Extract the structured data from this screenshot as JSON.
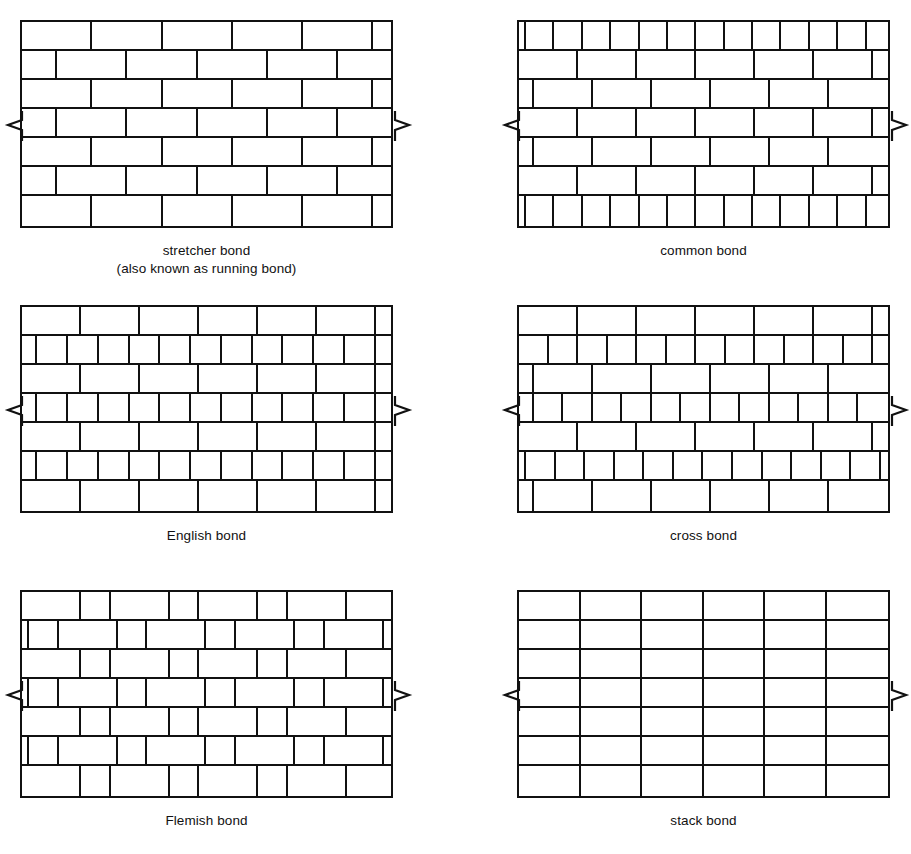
{
  "page": {
    "background": "#ffffff",
    "line_color": "#111111",
    "top_artifact": "· ·   ·    ·  ·     ·   ···"
  },
  "legend": {
    "brick_unit_note": "widths expressed in half-brick modules",
    "break_symbol": "zigzag-break"
  },
  "panels": [
    {
      "id": "stretcher-bond",
      "caption": "stretcher bond",
      "caption2": "(also known as running bond)",
      "col": 0,
      "row": 0,
      "courses": [
        [
          4,
          4,
          4,
          4,
          4,
          1
        ],
        [
          2,
          4,
          4,
          4,
          4,
          3
        ],
        [
          4,
          4,
          4,
          4,
          4,
          1
        ],
        [
          2,
          4,
          4,
          4,
          4,
          3
        ],
        [
          4,
          4,
          4,
          4,
          4,
          1
        ],
        [
          2,
          4,
          4,
          4,
          4,
          3
        ],
        [
          4,
          4,
          4,
          4,
          4,
          1
        ]
      ]
    },
    {
      "id": "common-bond",
      "caption": "common bond",
      "caption2": "",
      "col": 1,
      "row": 0,
      "courses": [
        [
          0.5,
          2,
          2,
          2,
          2,
          2,
          2,
          2,
          2,
          2,
          2,
          2,
          2,
          1.5
        ],
        [
          4,
          4,
          4,
          4,
          4,
          4,
          1
        ],
        [
          1,
          4,
          4,
          4,
          4,
          4,
          4
        ],
        [
          4,
          4,
          4,
          4,
          4,
          4,
          1
        ],
        [
          1,
          4,
          4,
          4,
          4,
          4,
          4
        ],
        [
          4,
          4,
          4,
          4,
          4,
          4,
          1
        ],
        [
          0.5,
          2,
          2,
          2,
          2,
          2,
          2,
          2,
          2,
          2,
          2,
          2,
          2,
          1.5
        ]
      ]
    },
    {
      "id": "english-bond",
      "caption": "English bond",
      "caption2": "",
      "col": 0,
      "row": 1,
      "courses": [
        [
          4,
          4,
          4,
          4,
          4,
          4,
          1
        ],
        [
          1,
          2,
          2,
          2,
          2,
          2,
          2,
          2,
          2,
          2,
          2,
          2,
          1
        ],
        [
          4,
          4,
          4,
          4,
          4,
          4,
          1
        ],
        [
          1,
          2,
          2,
          2,
          2,
          2,
          2,
          2,
          2,
          2,
          2,
          2,
          1
        ],
        [
          4,
          4,
          4,
          4,
          4,
          4,
          1
        ],
        [
          1,
          2,
          2,
          2,
          2,
          2,
          2,
          2,
          2,
          2,
          2,
          2,
          1
        ],
        [
          4,
          4,
          4,
          4,
          4,
          4,
          1
        ]
      ]
    },
    {
      "id": "cross-bond",
      "caption": "cross bond",
      "caption2": "",
      "col": 1,
      "row": 1,
      "courses": [
        [
          4,
          4,
          4,
          4,
          4,
          4,
          1
        ],
        [
          2,
          2,
          2,
          2,
          2,
          2,
          2,
          2,
          2,
          2,
          2,
          2,
          1
        ],
        [
          1,
          4,
          4,
          4,
          4,
          4,
          4
        ],
        [
          1,
          2,
          2,
          2,
          2,
          2,
          2,
          2,
          2,
          2,
          2,
          2,
          2
        ],
        [
          4,
          4,
          4,
          4,
          4,
          4,
          1
        ],
        [
          0.5,
          2,
          2,
          2,
          2,
          2,
          2,
          2,
          2,
          2,
          2,
          2,
          2,
          0.5
        ],
        [
          1,
          4,
          4,
          4,
          4,
          4,
          4
        ]
      ]
    },
    {
      "id": "flemish-bond",
      "caption": "Flemish bond",
      "caption2": "",
      "col": 0,
      "row": 2,
      "courses": [
        [
          4,
          2,
          4,
          2,
          4,
          2,
          4,
          3
        ],
        [
          0.5,
          2,
          4,
          2,
          4,
          2,
          4,
          2,
          4,
          0.5
        ],
        [
          4,
          2,
          4,
          2,
          4,
          2,
          4,
          3
        ],
        [
          0.5,
          2,
          4,
          2,
          4,
          2,
          4,
          2,
          4,
          0.5
        ],
        [
          4,
          2,
          4,
          2,
          4,
          2,
          4,
          3
        ],
        [
          0.5,
          2,
          4,
          2,
          4,
          2,
          4,
          2,
          4,
          0.5
        ],
        [
          4,
          2,
          4,
          2,
          4,
          2,
          4,
          3
        ]
      ]
    },
    {
      "id": "stack-bond",
      "caption": "stack bond",
      "caption2": "",
      "col": 1,
      "row": 2,
      "courses": [
        [
          4,
          4,
          4,
          4,
          4,
          4
        ],
        [
          4,
          4,
          4,
          4,
          4,
          4
        ],
        [
          4,
          4,
          4,
          4,
          4,
          4
        ],
        [
          4,
          4,
          4,
          4,
          4,
          4
        ],
        [
          4,
          4,
          4,
          4,
          4,
          4
        ],
        [
          4,
          4,
          4,
          4,
          4,
          4
        ],
        [
          4,
          4,
          4,
          4,
          4,
          4
        ]
      ]
    }
  ]
}
